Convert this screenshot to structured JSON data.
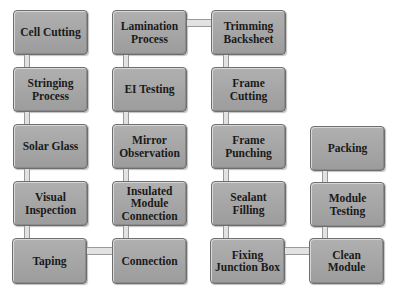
{
  "diagram": {
    "type": "process-flow",
    "columns": [
      {
        "steps": [
          "Cell Cutting",
          "Stringing Process",
          "Solar Glass",
          "Visual Inspection",
          "Taping"
        ],
        "direction": "down"
      },
      {
        "steps": [
          "Connection",
          "Insulated Module Connection",
          "Mirror Observation",
          "EI Testing",
          "Lamination Process"
        ],
        "direction": "up"
      },
      {
        "steps": [
          "Trimming Backsheet",
          "Frame Cutting",
          "Frame Punching",
          "Sealant Filling",
          "Fixing Junction Box"
        ],
        "direction": "down"
      },
      {
        "steps": [
          "Clean Module",
          "Module Testing",
          "Packing"
        ],
        "direction": "up"
      }
    ],
    "nodes": {
      "c1r1": "Cell Cutting",
      "c1r2": "Stringing Process",
      "c1r3": "Solar Glass",
      "c1r4": "Visual Inspection",
      "c1r5": "Taping",
      "c2r1": "Lamination Process",
      "c2r2": "EI Testing",
      "c2r3": "Mirror Observation",
      "c2r4": "Insulated Module Connection",
      "c2r5": "Connection",
      "c3r1": "Trimming Backsheet",
      "c3r2": "Frame Cutting",
      "c3r3": "Frame Punching",
      "c3r4": "Sealant Filling",
      "c3r5": "Fixing Junction Box",
      "c4r3": "Packing",
      "c4r4": "Module Testing",
      "c4r5": "Clean Module"
    },
    "colors": {
      "box_fill": "#a8a8a8",
      "box_border": "#6e6e6e",
      "connector_fill": "#e2e2e2",
      "text": "#1a1a1a",
      "background": "#ffffff"
    }
  }
}
